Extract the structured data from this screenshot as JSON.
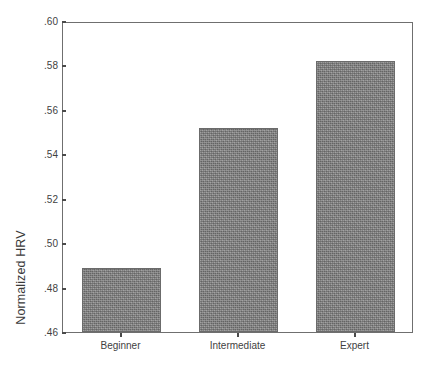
{
  "chart_data": {
    "type": "bar",
    "title": "",
    "subtitle": "",
    "xlabel": "",
    "ylabel": "Normalized HRV",
    "categories": [
      "Beginner",
      "Intermediate",
      "Expert"
    ],
    "values": [
      0.489,
      0.552,
      0.582
    ],
    "value_labels": [
      "",
      "",
      ""
    ],
    "ylim": [
      0.46,
      0.6
    ],
    "ytick_values": [
      0.46,
      0.48,
      0.5,
      0.52,
      0.54,
      0.56,
      0.58,
      0.6
    ],
    "ytick_labels": [
      ".46",
      ".48",
      ".50",
      ".52",
      ".54",
      ".56",
      ".58",
      ".60"
    ],
    "ytick_step": 0.02,
    "grid": false,
    "legend": false,
    "legend_position": "none",
    "series": [
      {
        "name": "Normalized HRV",
        "values": [
          0.489,
          0.552,
          0.582
        ]
      }
    ],
    "annotations": []
  },
  "style": {
    "bar_color": "#808080",
    "bar_edge_color": "#6b6b6b",
    "frame_color": "#6f6f6f",
    "text_color": "#3f3f3f",
    "axis_title_color": "#3a3a3a",
    "background": "#ffffff"
  }
}
